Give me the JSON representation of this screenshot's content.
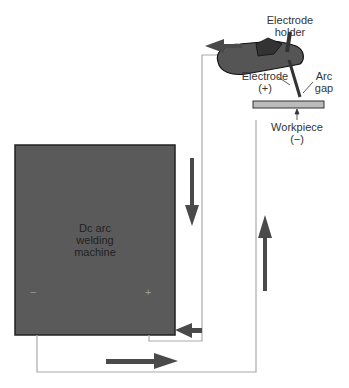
{
  "diagram": {
    "machine": {
      "label_line1": "Dc arc",
      "label_line2": "welding",
      "label_line3": "machine",
      "neg_terminal": "−",
      "pos_terminal": "+"
    },
    "labels": {
      "electrode_holder_1": "Electrode",
      "electrode_holder_2": "holder",
      "electrode_1": "Electrode",
      "electrode_2": "(+)",
      "arc_gap_1": "Arc",
      "arc_gap_2": "gap",
      "workpiece_1": "Workpiece",
      "workpiece_2": "(−)"
    },
    "colors": {
      "machine": "#555555",
      "arrow": "#4a4a4a",
      "wire": "#aaaaaa",
      "workpiece": "#bbbbbb"
    }
  }
}
